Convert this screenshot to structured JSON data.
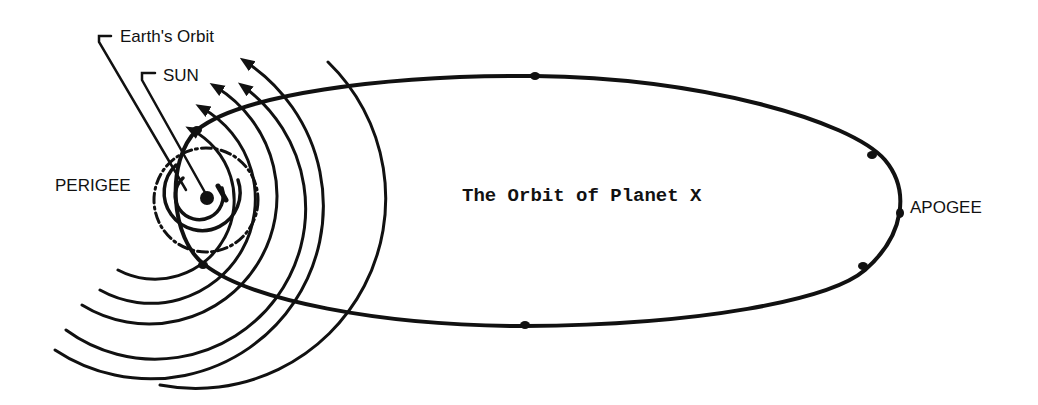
{
  "diagram": {
    "title": "The Orbit of Planet X",
    "labels": {
      "earths_orbit": "Earth's Orbit",
      "sun": "SUN",
      "perigee": "PERIGEE",
      "apogee": "APOGEE"
    },
    "colors": {
      "ink": "#111111",
      "background": "#ffffff"
    },
    "wave_arc_count": 8,
    "orbit_direction_markers": 6
  }
}
